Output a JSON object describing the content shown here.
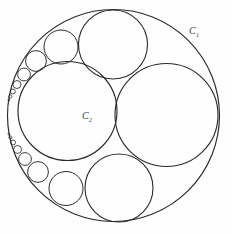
{
  "figure": {
    "kind": "circle-packing-diagram",
    "background_color": "#fefefe",
    "stroke_color": "#2a2a2c",
    "canvas": {
      "width": 232,
      "height": 234
    },
    "labels": [
      {
        "id": "outer-circle-label",
        "base": "C",
        "subscript": "1",
        "full": "C₁",
        "x": 189,
        "y": 34
      },
      {
        "id": "inner-circle-label",
        "base": "C",
        "subscript": "2",
        "full": "C₂",
        "x": 82,
        "y": 119
      }
    ],
    "circles": [
      {
        "id": "outer-boundary-c1",
        "name": "outer-circle-c1",
        "cx": 113.5,
        "cy": 115.5,
        "r": 106.0,
        "stroke_width": 1.15
      },
      {
        "id": "inner-large-c2",
        "name": "inner-circle-c2",
        "cx": 67.5,
        "cy": 111.0,
        "r": 49.5,
        "stroke_width": 1.15
      },
      {
        "id": "right-large",
        "name": "right-large-circle",
        "cx": 166.5,
        "cy": 115.0,
        "r": 51.5,
        "stroke_width": 1.15
      },
      {
        "id": "top-large",
        "name": "top-large-circle",
        "cx": 113.0,
        "cy": 44.5,
        "r": 34.5,
        "stroke_width": 1.1
      },
      {
        "id": "bottom-large",
        "name": "bottom-large-circle",
        "cx": 119.0,
        "cy": 188.0,
        "r": 34.0,
        "stroke_width": 1.1
      },
      {
        "id": "ul-medium",
        "name": "upper-left-medium-circle",
        "cx": 61.0,
        "cy": 47.0,
        "r": 17.0,
        "stroke_width": 1.0
      },
      {
        "id": "ll-medium",
        "name": "lower-left-medium-circle",
        "cx": 66.0,
        "cy": 188.5,
        "r": 17.0,
        "stroke_width": 1.0
      },
      {
        "id": "ul-chain-1",
        "name": "upper-left-chain-circle",
        "cx": 36.0,
        "cy": 61.0,
        "r": 10.4,
        "stroke_width": 0.95
      },
      {
        "id": "ul-chain-2",
        "name": "upper-left-chain-circle",
        "cx": 24.0,
        "cy": 74.5,
        "r": 6.4,
        "stroke_width": 0.9
      },
      {
        "id": "ul-chain-3",
        "name": "upper-left-chain-circle",
        "cx": 17.0,
        "cy": 84.5,
        "r": 4.0,
        "stroke_width": 0.85
      },
      {
        "id": "ul-chain-4",
        "name": "upper-left-chain-circle",
        "cx": 12.8,
        "cy": 91.5,
        "r": 2.5,
        "stroke_width": 0.8
      },
      {
        "id": "ul-chain-5",
        "name": "upper-left-chain-circle",
        "cx": 10.3,
        "cy": 96.5,
        "r": 1.6,
        "stroke_width": 0.75
      },
      {
        "id": "ul-chain-6",
        "name": "upper-left-chain-circle",
        "cx": 8.9,
        "cy": 100.0,
        "r": 1.0,
        "stroke_width": 0.7
      },
      {
        "id": "ll-chain-1",
        "name": "lower-left-chain-circle",
        "cx": 38.0,
        "cy": 172.0,
        "r": 10.4,
        "stroke_width": 0.95
      },
      {
        "id": "ll-chain-2",
        "name": "lower-left-chain-circle",
        "cx": 25.0,
        "cy": 159.0,
        "r": 6.4,
        "stroke_width": 0.9
      },
      {
        "id": "ll-chain-3",
        "name": "lower-left-chain-circle",
        "cx": 17.5,
        "cy": 149.5,
        "r": 4.0,
        "stroke_width": 0.85
      },
      {
        "id": "ll-chain-4",
        "name": "lower-left-chain-circle",
        "cx": 13.0,
        "cy": 142.5,
        "r": 2.5,
        "stroke_width": 0.8
      },
      {
        "id": "ll-chain-5",
        "name": "lower-left-chain-circle",
        "cx": 10.4,
        "cy": 137.5,
        "r": 1.6,
        "stroke_width": 0.75
      },
      {
        "id": "ll-chain-6",
        "name": "lower-left-chain-circle",
        "cx": 8.9,
        "cy": 134.0,
        "r": 1.0,
        "stroke_width": 0.7
      }
    ]
  }
}
